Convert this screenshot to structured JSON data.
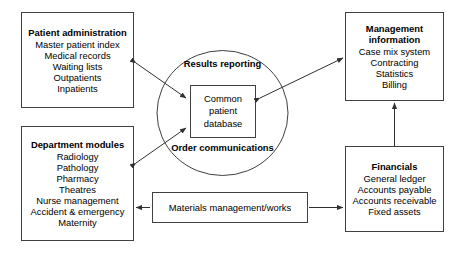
{
  "diagram": {
    "stroke_color": "#404040",
    "text_color": "#000000",
    "background": "#ffffff"
  },
  "nodes": {
    "patient_administration": {
      "title": "Patient administration",
      "items": [
        "Master patient index",
        "Medical records",
        "Waiting lists",
        "Outpatients",
        "Inpatients"
      ]
    },
    "department_modules": {
      "title": "Department modules",
      "items": [
        "Radiology",
        "Pathology",
        "Pharmacy",
        "Theatres",
        "Nurse management",
        "Accident & emergency",
        "Maternity"
      ]
    },
    "management_information": {
      "title_line1": "Management",
      "title_line2": "information",
      "items": [
        "Case mix system",
        "Contracting",
        "Statistics",
        "Billing"
      ]
    },
    "financials": {
      "title": "Financials",
      "items": [
        "General ledger",
        "Accounts payable",
        "Accounts receivable",
        "Fixed assets"
      ]
    },
    "materials_management": {
      "title": "Materials management/works"
    },
    "central_circle": {
      "top_label": "Results reporting",
      "bottom_label": "Order communications"
    },
    "common_database": {
      "line1": "Common",
      "line2": "patient",
      "line3": "database"
    }
  }
}
